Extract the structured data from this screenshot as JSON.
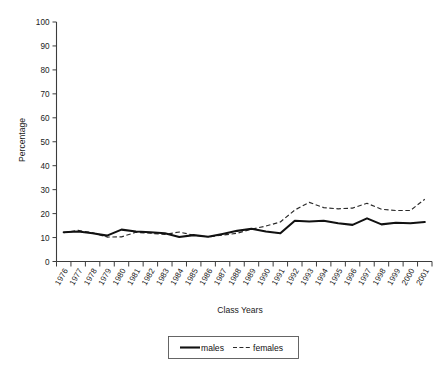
{
  "chart_data": {
    "type": "line",
    "title": "",
    "xlabel": "Class Years",
    "ylabel": "Percentage",
    "ylim": [
      0,
      100
    ],
    "yticks": [
      0,
      10,
      20,
      30,
      40,
      50,
      60,
      70,
      80,
      90,
      100
    ],
    "grid": false,
    "legend_position": "bottom-center",
    "categories": [
      "1976",
      "1977",
      "1978",
      "1979",
      "1980",
      "1981",
      "1982",
      "1983",
      "1984",
      "1985",
      "1986",
      "1987",
      "1988",
      "1989",
      "1990",
      "1991",
      "1992",
      "1993",
      "1994",
      "1995",
      "1996",
      "1997",
      "1998",
      "1999",
      "2000",
      "2001"
    ],
    "series": [
      {
        "name": "males",
        "style": "solid",
        "color": "#111111",
        "values": [
          12.2,
          12.5,
          11.8,
          10.8,
          13.3,
          12.5,
          12.2,
          11.8,
          10.2,
          11.0,
          10.3,
          11.5,
          12.8,
          13.7,
          12.5,
          11.8,
          17.0,
          16.7,
          17.0,
          16.0,
          15.3,
          18.0,
          15.5,
          16.2,
          16.0,
          16.5
        ]
      },
      {
        "name": "females",
        "style": "dashed",
        "color": "#2a2a2a",
        "values": [
          12.0,
          13.0,
          12.0,
          10.2,
          10.3,
          12.2,
          11.8,
          11.3,
          12.3,
          11.0,
          10.3,
          11.0,
          11.8,
          13.5,
          14.8,
          16.5,
          21.5,
          24.7,
          22.5,
          22.0,
          22.3,
          24.3,
          21.8,
          21.3,
          21.3,
          26.0
        ]
      }
    ]
  },
  "axis": {
    "y_label": "Percentage",
    "x_label": "Class Years",
    "y_tick_labels": [
      "100",
      "90",
      "80",
      "70",
      "60",
      "50",
      "40",
      "30",
      "20",
      "10",
      "0"
    ]
  },
  "legend": {
    "entries": [
      {
        "label": "males",
        "style": "solid"
      },
      {
        "label": "females",
        "style": "dashed"
      }
    ]
  }
}
